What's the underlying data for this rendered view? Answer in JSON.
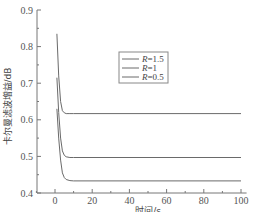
{
  "chart_data": {
    "type": "line",
    "title": "",
    "xlabel": "时间/s",
    "ylabel": "卡尔曼滤波增益/dB",
    "xlim": [
      -10,
      103
    ],
    "ylim": [
      0.4,
      0.9
    ],
    "xticks": [
      0,
      20,
      40,
      60,
      80,
      100
    ],
    "xtick_labels": [
      "0",
      "20",
      "40",
      "60",
      "80",
      "100"
    ],
    "yticks": [
      0.4,
      0.5,
      0.6,
      0.7,
      0.8,
      0.9
    ],
    "ytick_labels": [
      "0.4",
      "0.5",
      "0.6",
      "0.7",
      "0.8",
      "0.9"
    ],
    "grid": false,
    "legend_position": "upper-center",
    "series": [
      {
        "name": "R=1.5",
        "legend_label": "R=1.5",
        "x": [
          1,
          2,
          3,
          4,
          5,
          6,
          8,
          10,
          100
        ],
        "y": [
          0.835,
          0.72,
          0.65,
          0.625,
          0.619,
          0.617,
          0.617,
          0.617,
          0.617
        ]
      },
      {
        "name": "R=1",
        "legend_label": "R=1",
        "x": [
          1,
          2,
          3,
          4,
          5,
          6,
          8,
          10,
          100
        ],
        "y": [
          0.715,
          0.62,
          0.55,
          0.515,
          0.503,
          0.499,
          0.497,
          0.497,
          0.497
        ]
      },
      {
        "name": "R=0.5",
        "legend_label": "R=0.5",
        "x": [
          1,
          2,
          3,
          4,
          5,
          6,
          8,
          10,
          100
        ],
        "y": [
          0.63,
          0.55,
          0.49,
          0.455,
          0.442,
          0.437,
          0.434,
          0.433,
          0.433
        ]
      }
    ]
  }
}
